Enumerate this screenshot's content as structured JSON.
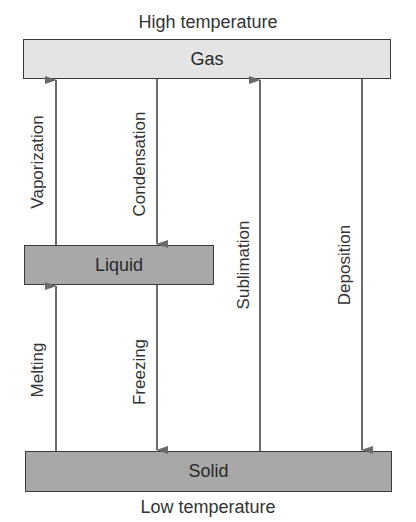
{
  "diagram": {
    "title_top": "High temperature",
    "title_bottom": "Low temperature",
    "states": {
      "gas": {
        "label": "Gas",
        "fill": "#e4e4e4"
      },
      "liquid": {
        "label": "Liquid",
        "fill": "#a8a8a8"
      },
      "solid": {
        "label": "Solid",
        "fill": "#a8a8a8"
      }
    },
    "transitions": {
      "vaporization": {
        "label": "Vaporization",
        "from": "Liquid",
        "to": "Gas"
      },
      "condensation": {
        "label": "Condensation",
        "from": "Gas",
        "to": "Liquid"
      },
      "melting": {
        "label": "Melting",
        "from": "Solid",
        "to": "Liquid"
      },
      "freezing": {
        "label": "Freezing",
        "from": "Liquid",
        "to": "Solid"
      },
      "sublimation": {
        "label": "Sublimation",
        "from": "Solid",
        "to": "Gas"
      },
      "deposition": {
        "label": "Deposition",
        "from": "Gas",
        "to": "Solid"
      }
    },
    "arrow_color": "#6a6a6a"
  }
}
